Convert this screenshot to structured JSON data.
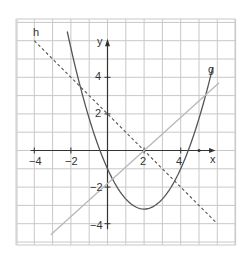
{
  "chart_data": {
    "type": "line",
    "title": "",
    "xlabel": "x",
    "ylabel": "y",
    "xlim": [
      -5,
      7
    ],
    "ylim": [
      -5.2,
      7.1
    ],
    "grid": true,
    "x_ticks": [
      -4,
      -2,
      2,
      4
    ],
    "y_ticks": [
      4,
      2,
      -2,
      -4
    ],
    "x_tick_labels": [
      "−4",
      "−2",
      "2",
      "4"
    ],
    "y_tick_labels": [
      "4",
      "2",
      "−2",
      "−4"
    ],
    "series": [
      {
        "name": "g",
        "style": "solid",
        "color": "#555555",
        "kind": "parabola",
        "formula": "0.55*(x-2)^2-3.2",
        "x_range": [
          -2.2,
          5.75
        ],
        "points": [
          [
            -2.2,
            6.5
          ],
          [
            -1,
            1.75
          ],
          [
            0,
            -1.0
          ],
          [
            1,
            -2.65
          ],
          [
            2,
            -3.2
          ],
          [
            3,
            -2.65
          ],
          [
            4,
            -1.0
          ],
          [
            5,
            1.75
          ],
          [
            5.75,
            4.5
          ]
        ]
      },
      {
        "name": "h",
        "style": "dashed",
        "color": "#555555",
        "kind": "line",
        "formula": "-x+2",
        "x_range": [
          -4,
          6
        ],
        "points": [
          [
            -4,
            6
          ],
          [
            2,
            0
          ],
          [
            6,
            -4
          ]
        ]
      },
      {
        "name": "",
        "style": "solid",
        "color": "#b8b8b8",
        "kind": "line",
        "formula": "0.9*(x-2)",
        "x_range": [
          -3.1,
          6.1
        ],
        "points": [
          [
            -3.1,
            -4.6
          ],
          [
            2,
            0
          ],
          [
            6.1,
            3.7
          ]
        ]
      }
    ],
    "annotations": [
      {
        "text": "h",
        "x": -4.1,
        "y": 6.3
      },
      {
        "text": "g",
        "x": 5.7,
        "y": 4.6
      },
      {
        "text": "x",
        "x": 5.9,
        "y": -0.45
      },
      {
        "text": "y",
        "x": -0.4,
        "y": 5.9
      }
    ]
  },
  "labels": {
    "h": "h",
    "g": "g",
    "x_axis": "x",
    "y_axis": "y",
    "tick_xm4": "−4",
    "tick_xm2": "−2",
    "tick_x2": "2",
    "tick_x4": "4",
    "tick_y4": "4",
    "tick_y2": "2",
    "tick_ym2": "−2",
    "tick_ym4": "−4"
  }
}
